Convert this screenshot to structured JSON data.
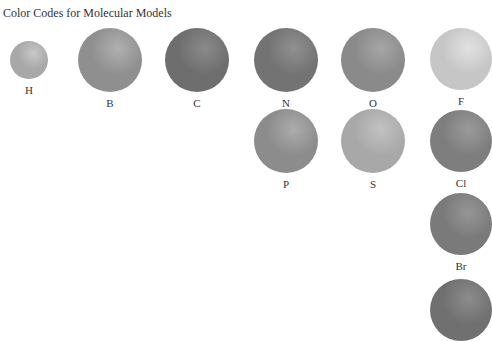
{
  "title": "Color Codes for Molecular Models",
  "atoms": [
    {
      "symbol": "H",
      "cx": 29,
      "cy": 60,
      "r": 19,
      "tone": "#a8a8a8",
      "light": "#c8c8c8"
    },
    {
      "symbol": "B",
      "cx": 110,
      "cy": 60,
      "r": 32,
      "tone": "#8f8f8f",
      "light": "#b0b0b0"
    },
    {
      "symbol": "C",
      "cx": 197,
      "cy": 60,
      "r": 32,
      "tone": "#6e6e6e",
      "light": "#8a8a8a"
    },
    {
      "symbol": "N",
      "cx": 286,
      "cy": 60,
      "r": 32,
      "tone": "#737373",
      "light": "#909090"
    },
    {
      "symbol": "O",
      "cx": 373,
      "cy": 60,
      "r": 32,
      "tone": "#8a8a8a",
      "light": "#a6a6a6"
    },
    {
      "symbol": "F",
      "cx": 461,
      "cy": 59,
      "r": 31,
      "tone": "#c6c6c6",
      "light": "#e2e2e2"
    },
    {
      "symbol": "P",
      "cx": 286,
      "cy": 141,
      "r": 32,
      "tone": "#8c8c8c",
      "light": "#acacac"
    },
    {
      "symbol": "S",
      "cx": 373,
      "cy": 141,
      "r": 32,
      "tone": "#a8a8a8",
      "light": "#c2c2c2"
    },
    {
      "symbol": "Cl",
      "cx": 461,
      "cy": 141,
      "r": 31,
      "tone": "#7e7e7e",
      "light": "#9a9a9a"
    },
    {
      "symbol": "Br",
      "cx": 461,
      "cy": 224,
      "r": 31,
      "tone": "#7a7a7a",
      "light": "#969696"
    },
    {
      "symbol": "",
      "cx": 461,
      "cy": 310,
      "r": 31,
      "tone": "#707070",
      "light": "#8c8c8c"
    }
  ]
}
